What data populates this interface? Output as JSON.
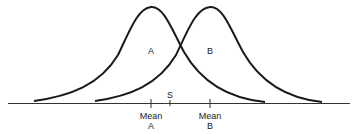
{
  "diagram": {
    "type": "overlapping-normal-distributions",
    "distributions": [
      {
        "label": "A",
        "mean_label_line1": "Mean",
        "mean_label_line2": "A"
      },
      {
        "label": "B",
        "mean_label_line1": "Mean",
        "mean_label_line2": "B"
      }
    ],
    "criterion_label": "S",
    "colors": {
      "curve": "#1a1a1a",
      "axis": "#333333",
      "text": "#222222",
      "background": "#ffffff"
    }
  }
}
